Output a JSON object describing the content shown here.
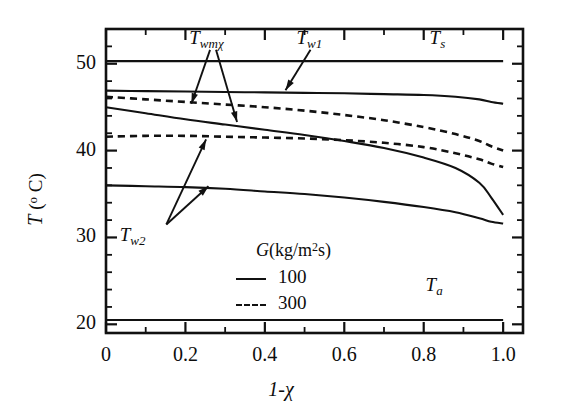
{
  "chart_data": {
    "type": "line",
    "title": "",
    "xlabel": "1-χ",
    "ylabel": "T (°C)",
    "xlim": [
      0,
      1.05
    ],
    "ylim": [
      19.0,
      54.0
    ],
    "grid": false,
    "legend_position": "inside-bottom-right",
    "x_ticks": [
      "0",
      "0.2",
      "0.4",
      "0.6",
      "0.8",
      "1.0"
    ],
    "x_tick_values": [
      0,
      0.2,
      0.4,
      0.6,
      0.8,
      1.0
    ],
    "x_minor_step": 0.1,
    "y_ticks": [
      "20",
      "30",
      "40",
      "50"
    ],
    "y_tick_values": [
      20,
      30,
      40,
      50
    ],
    "y_minor_step": 2,
    "legend": {
      "title": "G (kg/m²s)",
      "title_symbol": "G",
      "title_units": "(kg/m",
      "title_exp": "2",
      "title_tail": "s)",
      "entries": [
        {
          "label": "100",
          "style": "solid"
        },
        {
          "label": "300",
          "style": "dashed"
        }
      ]
    },
    "annotations": [
      {
        "name": "Twmχ",
        "base": "T",
        "sub": "wmχ",
        "x": 0.25,
        "y": 52.6
      },
      {
        "name": "Tw1",
        "base": "T",
        "sub": "w1",
        "x": 0.52,
        "y": 52.6
      },
      {
        "name": "Ts",
        "base": "T",
        "sub": "s",
        "x": 0.855,
        "y": 52.6
      },
      {
        "name": "Tw2",
        "base": "T",
        "sub": "w2",
        "x": 0.075,
        "y": 29.9
      },
      {
        "name": "Ta",
        "base": "T",
        "sub": "a",
        "x": 0.845,
        "y": 24.2
      }
    ],
    "series": [
      {
        "name": "Ts",
        "style": "solid",
        "G": null,
        "x": [
          0.0,
          0.2,
          0.4,
          0.6,
          0.8,
          1.0
        ],
        "y": [
          50.3,
          50.3,
          50.3,
          50.3,
          50.3,
          50.3
        ]
      },
      {
        "name": "Tw1",
        "style": "solid",
        "G": 100,
        "x": [
          0.0,
          0.1,
          0.2,
          0.3,
          0.4,
          0.5,
          0.6,
          0.7,
          0.8,
          0.88,
          0.94,
          0.97,
          1.0
        ],
        "y": [
          46.9,
          46.85,
          46.8,
          46.75,
          46.7,
          46.65,
          46.6,
          46.5,
          46.4,
          46.2,
          45.9,
          45.6,
          45.4
        ]
      },
      {
        "name": "Twmχ (G=300)",
        "style": "dashed",
        "G": 300,
        "x": [
          0.0,
          0.1,
          0.2,
          0.3,
          0.4,
          0.5,
          0.6,
          0.7,
          0.8,
          0.88,
          0.94,
          0.97,
          1.0
        ],
        "y": [
          46.2,
          45.9,
          45.6,
          45.3,
          45.0,
          44.6,
          44.1,
          43.5,
          42.7,
          41.9,
          41.1,
          40.5,
          40.0
        ]
      },
      {
        "name": "Twmχ (G=100)",
        "style": "solid",
        "G": 100,
        "x": [
          0.0,
          0.1,
          0.2,
          0.3,
          0.4,
          0.5,
          0.6,
          0.7,
          0.8,
          0.88,
          0.94,
          0.97,
          1.0
        ],
        "y": [
          45.0,
          44.3,
          43.6,
          43.0,
          42.4,
          41.8,
          41.1,
          40.3,
          39.2,
          38.0,
          36.3,
          34.6,
          32.6
        ]
      },
      {
        "name": "Tw2 (G=300)",
        "style": "dashed",
        "G": 300,
        "x": [
          0.0,
          0.1,
          0.2,
          0.3,
          0.4,
          0.5,
          0.6,
          0.7,
          0.8,
          0.88,
          0.94,
          0.97,
          1.0
        ],
        "y": [
          41.6,
          41.7,
          41.7,
          41.6,
          41.5,
          41.4,
          41.2,
          40.9,
          40.4,
          39.7,
          39.0,
          38.5,
          38.1
        ]
      },
      {
        "name": "Tw2 (G=100)",
        "style": "solid",
        "G": 100,
        "x": [
          0.0,
          0.1,
          0.2,
          0.3,
          0.4,
          0.5,
          0.6,
          0.7,
          0.8,
          0.88,
          0.94,
          0.97,
          1.0
        ],
        "y": [
          36.0,
          35.9,
          35.8,
          35.6,
          35.3,
          35.0,
          34.6,
          34.1,
          33.5,
          32.9,
          32.2,
          31.8,
          31.6
        ]
      },
      {
        "name": "Ta",
        "style": "solid",
        "G": null,
        "x": [
          0.0,
          0.2,
          0.4,
          0.6,
          0.8,
          1.0
        ],
        "y": [
          20.5,
          20.5,
          20.5,
          20.5,
          20.5,
          20.5
        ]
      }
    ]
  },
  "style": {
    "axis_color": "#111111",
    "curve_color": "#111111",
    "background": "#ffffff"
  }
}
